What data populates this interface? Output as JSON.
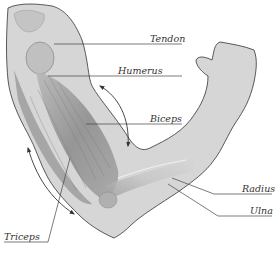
{
  "diagram": {
    "labels": {
      "tendon": "Tendon",
      "humerus": "Humerus",
      "biceps": "Biceps",
      "radius": "Radius",
      "ulna": "Ulna",
      "triceps": "Triceps"
    },
    "colors": {
      "skin_fill": "#d4d4d4",
      "outline": "#333333",
      "muscle_dark": "#8a8a8a",
      "muscle_light": "#bdbdbd",
      "leader_line": "#444444"
    }
  }
}
